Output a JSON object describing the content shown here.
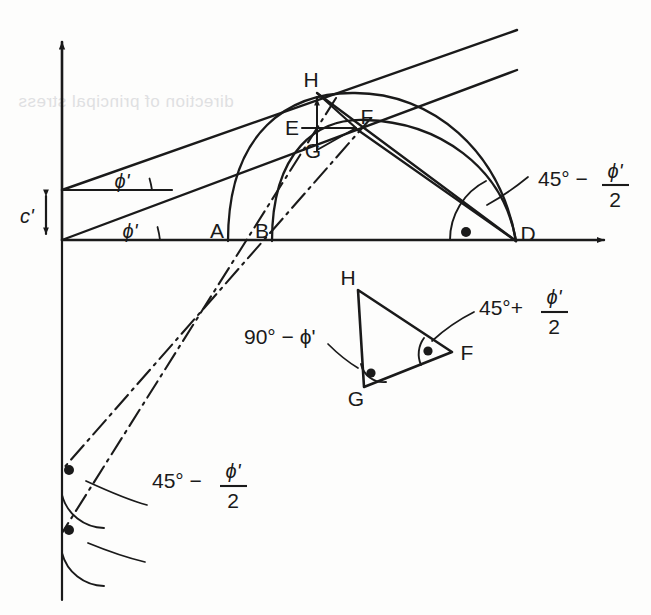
{
  "figure": {
    "kind": "geometric-construction-diagram",
    "background_color": "#fdfdfc",
    "ink_color": "#1a1a1a",
    "bleed_text": "direction of principal stress"
  },
  "axes": {
    "x_axis_label": "",
    "y_axis_label": "",
    "origin_label": "",
    "cohesion_label": "c'"
  },
  "angles": {
    "phi_upper": "ϕ'",
    "phi_lower": "ϕ'",
    "at_D_num": "45° −",
    "at_D_frac_top": "ϕ'",
    "at_D_frac_bottom": "2",
    "lower_left_num": "45° −",
    "lower_left_frac_top": "ϕ'",
    "lower_left_frac_bottom": "2",
    "triangle_G": "90° − ϕ'",
    "triangle_F_num": "45°+",
    "triangle_F_frac_top": "ϕ'",
    "triangle_F_frac_bottom": "2"
  },
  "points": {
    "A": "A",
    "B": "B",
    "D": "D",
    "E": "E",
    "F": "F",
    "G": "G",
    "H": "H",
    "tri_H": "H",
    "tri_G": "G",
    "tri_F": "F"
  }
}
